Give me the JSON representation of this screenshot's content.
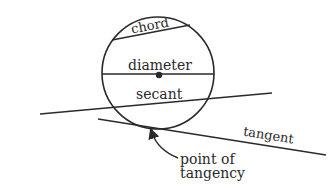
{
  "diagram": {
    "colors": {
      "stroke": "#2a2a2a",
      "background": "#ffffff"
    },
    "circle": {
      "cx": 158,
      "cy": 73,
      "r": 56
    },
    "labels": {
      "chord": "chord",
      "diameter": "diameter",
      "secant": "secant",
      "tangent": "tangent",
      "point_of_tangency_line1": "point of",
      "point_of_tangency_line2": "tangency"
    }
  }
}
